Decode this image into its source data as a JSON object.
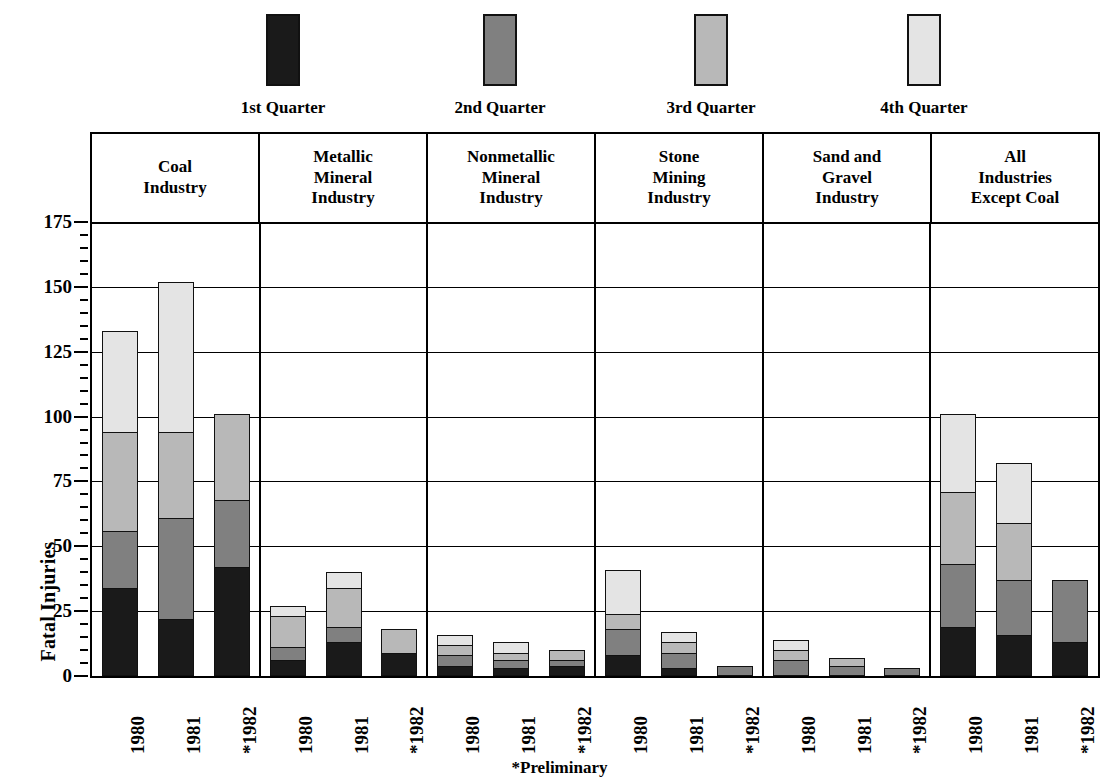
{
  "chart_data": {
    "type": "bar",
    "subtype": "stacked",
    "title": "",
    "xlabel": "",
    "ylabel": "Fatal Injuries",
    "ylim": [
      0,
      175
    ],
    "yticks": [
      0,
      25,
      50,
      75,
      100,
      125,
      150,
      175
    ],
    "ytick_labels": [
      "0",
      "25",
      "50",
      "75",
      "100",
      "125",
      "150",
      "175"
    ],
    "grid": true,
    "legend_position": "top",
    "footnote": "*Preliminary",
    "series": [
      {
        "name": "1st Quarter",
        "color": "#1a1a1a"
      },
      {
        "name": "2nd Quarter",
        "color": "#808080"
      },
      {
        "name": "3rd Quarter",
        "color": "#b8b8b8"
      },
      {
        "name": "4th Quarter",
        "color": "#e4e4e4"
      }
    ],
    "groups": [
      {
        "label": [
          "Coal",
          "Industry"
        ],
        "categories": [
          "1980",
          "1981",
          "*1982"
        ],
        "bars": [
          {
            "category": "1980",
            "values": [
              34,
              22,
              38,
              39
            ],
            "total": 133
          },
          {
            "category": "1981",
            "values": [
              22,
              39,
              33,
              58
            ],
            "total": 152
          },
          {
            "category": "*1982",
            "values": [
              42,
              26,
              33,
              0
            ],
            "total": 101
          }
        ]
      },
      {
        "label": [
          "Metallic",
          "Mineral",
          "Industry"
        ],
        "categories": [
          "1980",
          "1981",
          "*1982"
        ],
        "bars": [
          {
            "category": "1980",
            "values": [
              6,
              5,
              12,
              4
            ],
            "total": 27
          },
          {
            "category": "1981",
            "values": [
              13,
              6,
              15,
              6
            ],
            "total": 40
          },
          {
            "category": "*1982",
            "values": [
              9,
              0,
              9,
              0
            ],
            "total": 18
          }
        ]
      },
      {
        "label": [
          "Nonmetallic",
          "Mineral",
          "Industry"
        ],
        "categories": [
          "1980",
          "1981",
          "*1982"
        ],
        "bars": [
          {
            "category": "1980",
            "values": [
              4,
              4,
              4,
              4
            ],
            "total": 16
          },
          {
            "category": "1981",
            "values": [
              3,
              3,
              3,
              4
            ],
            "total": 13
          },
          {
            "category": "*1982",
            "values": [
              4,
              2,
              4,
              0
            ],
            "total": 10
          }
        ]
      },
      {
        "label": [
          "Stone",
          "Mining",
          "Industry"
        ],
        "categories": [
          "1980",
          "1981",
          "*1982"
        ],
        "bars": [
          {
            "category": "1980",
            "values": [
              8,
              10,
              6,
              17
            ],
            "total": 41
          },
          {
            "category": "1981",
            "values": [
              3,
              6,
              4,
              4
            ],
            "total": 17
          },
          {
            "category": "*1982",
            "values": [
              0,
              4,
              0,
              0
            ],
            "total": 4
          }
        ]
      },
      {
        "label": [
          "Sand and",
          "Gravel",
          "Industry"
        ],
        "categories": [
          "1980",
          "1981",
          "*1982"
        ],
        "bars": [
          {
            "category": "1980",
            "values": [
              0,
              6,
              4,
              4
            ],
            "total": 14
          },
          {
            "category": "1981",
            "values": [
              0,
              4,
              3,
              0
            ],
            "total": 7
          },
          {
            "category": "*1982",
            "values": [
              0,
              3,
              0,
              0
            ],
            "total": 3
          }
        ]
      },
      {
        "label": [
          "All",
          "Industries",
          "Except Coal"
        ],
        "categories": [
          "1980",
          "1981",
          "*1982"
        ],
        "bars": [
          {
            "category": "1980",
            "values": [
              19,
              24,
              28,
              30
            ],
            "total": 101
          },
          {
            "category": "1981",
            "values": [
              16,
              21,
              22,
              23
            ],
            "total": 82
          },
          {
            "category": "*1982",
            "values": [
              13,
              24,
              0,
              0
            ],
            "total": 37
          }
        ]
      }
    ]
  },
  "legend": {
    "items": [
      {
        "label": "1st Quarter",
        "color": "#1a1a1a"
      },
      {
        "label": "2nd Quarter",
        "color": "#808080"
      },
      {
        "label": "3rd Quarter",
        "color": "#b8b8b8"
      },
      {
        "label": "4th Quarter",
        "color": "#e4e4e4"
      }
    ]
  },
  "axis": {
    "y_title": "Fatal Injuries"
  },
  "footnote": "*Preliminary"
}
